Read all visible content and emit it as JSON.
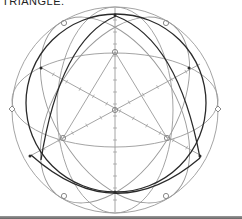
{
  "caption": "TRIANGLE.",
  "diagram": {
    "colors": {
      "light_line": "#9a9a9a",
      "dark_line": "#2a2a2a",
      "marker": "#8a8a8a"
    }
  }
}
